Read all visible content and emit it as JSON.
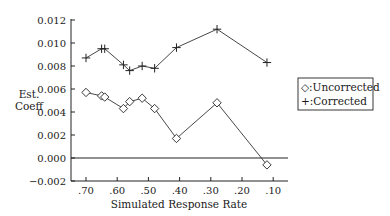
{
  "chart_data": {
    "type": "line",
    "title": "",
    "xlabel": "Simulated Response Rate",
    "ylabel": "Est.\nCoeff",
    "ylabel_lines": [
      "Est.",
      "Coeff"
    ],
    "xlim": [
      0.7,
      0.05
    ],
    "x_reversed": true,
    "ylim": [
      -0.002,
      0.012
    ],
    "x_ticks": [
      0.7,
      0.6,
      0.5,
      0.4,
      0.3,
      0.2,
      0.1
    ],
    "x_tick_labels": [
      ".70",
      ".60",
      ".50",
      ".40",
      ".30",
      ".20",
      ".10"
    ],
    "y_ticks": [
      -0.002,
      0.0,
      0.002,
      0.004,
      0.006,
      0.008,
      0.01,
      0.012
    ],
    "y_tick_labels": [
      "−0.002",
      "0.000",
      "0.002",
      "0.004",
      "0.006",
      "0.008",
      "0.010",
      "0.012"
    ],
    "reference_line_y": 0.0,
    "grid": false,
    "legend_position": "right",
    "series": [
      {
        "name": "Uncorrected",
        "legend_label": "◇:Uncorrected",
        "marker": "diamond",
        "x": [
          0.7,
          0.65,
          0.64,
          0.58,
          0.56,
          0.52,
          0.48,
          0.41,
          0.28,
          0.12
        ],
        "y": [
          0.0057,
          0.0054,
          0.0053,
          0.0043,
          0.0049,
          0.0052,
          0.0043,
          0.0017,
          0.0048,
          -0.0006
        ]
      },
      {
        "name": "Corrected",
        "legend_label": "+:Corrected",
        "marker": "plus",
        "x": [
          0.7,
          0.65,
          0.64,
          0.58,
          0.56,
          0.52,
          0.48,
          0.41,
          0.28,
          0.12
        ],
        "y": [
          0.0087,
          0.0095,
          0.0095,
          0.0081,
          0.0076,
          0.008,
          0.0078,
          0.0096,
          0.0112,
          0.0083
        ]
      }
    ]
  }
}
